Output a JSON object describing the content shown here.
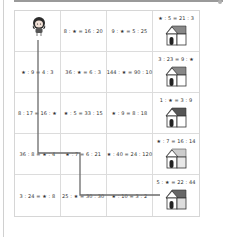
{
  "puzzle": {
    "star_symbol": "★",
    "rows": [
      [
        {
          "type": "start",
          "label": ""
        },
        {
          "type": "eq",
          "label": "8 : ★ = 16 : 20"
        },
        {
          "type": "eq",
          "label": "9 : ★ = 5 : 25"
        },
        {
          "type": "house",
          "label": "★ : 5 = 21 : 3"
        }
      ],
      [
        {
          "type": "eq",
          "label": "★ : 9 = 4 : 3"
        },
        {
          "type": "eq",
          "label": "36 : ★ = 6 : 3"
        },
        {
          "type": "eq",
          "label": "144 : ★ = 90 : 10"
        },
        {
          "type": "house",
          "label": "3 : 23 = 9 : ★"
        }
      ],
      [
        {
          "type": "eq",
          "label": "8 : 17 = 16 : ★"
        },
        {
          "type": "eq",
          "label": "★ : 5 = 33 : 15"
        },
        {
          "type": "eq",
          "label": "★ : 9 = 8 : 18"
        },
        {
          "type": "house",
          "label": "1 : ★ = 3 : 9"
        }
      ],
      [
        {
          "type": "eq",
          "label": "36 : 8 = ★ : 4"
        },
        {
          "type": "eq",
          "label": "★ : 7 = 6 : 21"
        },
        {
          "type": "eq",
          "label": "★ : 40 = 24 : 120"
        },
        {
          "type": "house",
          "label": "★ : 7 = 16 : 14"
        }
      ],
      [
        {
          "type": "eq",
          "label": "3 : 24 = ★ : 8"
        },
        {
          "type": "eq",
          "label": "25 : ★ = 30 : 30"
        },
        {
          "type": "eq",
          "label": "★ : 10 = 3 : 2"
        },
        {
          "type": "house",
          "label": "5 : ★ = 22 : 44"
        }
      ]
    ]
  },
  "colors": {
    "path_line": "#6b6b6b",
    "grid_line": "#dcdcdc",
    "text": "#333333"
  }
}
